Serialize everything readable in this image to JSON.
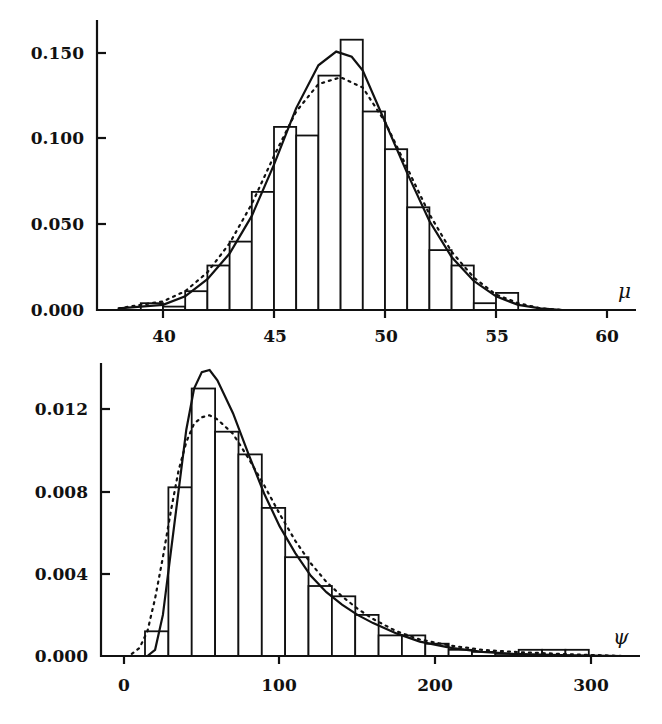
{
  "chart_data": [
    {
      "type": "bar",
      "subtype": "histogram with density overlays",
      "title": "",
      "xlabel": "μ",
      "ylabel": "",
      "xlim": [
        37.5,
        61.5
      ],
      "ylim": [
        0.0,
        0.16
      ],
      "xticks": [
        40,
        45,
        50,
        55,
        60
      ],
      "xtick_labels": [
        "40",
        "45",
        "50",
        "55",
        "60"
      ],
      "yticks": [
        0.0,
        0.05,
        0.1,
        0.15
      ],
      "ytick_labels": [
        "0.000",
        "0.050",
        "0.100",
        "0.150"
      ],
      "grid": false,
      "legend": null,
      "bins": [
        {
          "x0": 39.0,
          "x1": 40.0,
          "value": 0.004
        },
        {
          "x0": 40.0,
          "x1": 41.0,
          "value": 0.002
        },
        {
          "x0": 41.0,
          "x1": 42.0,
          "value": 0.011
        },
        {
          "x0": 42.0,
          "x1": 43.0,
          "value": 0.026
        },
        {
          "x0": 43.0,
          "x1": 44.0,
          "value": 0.04
        },
        {
          "x0": 44.0,
          "x1": 45.0,
          "value": 0.069
        },
        {
          "x0": 45.0,
          "x1": 46.0,
          "value": 0.107
        },
        {
          "x0": 46.0,
          "x1": 47.0,
          "value": 0.102
        },
        {
          "x0": 47.0,
          "x1": 48.0,
          "value": 0.137
        },
        {
          "x0": 48.0,
          "x1": 49.0,
          "value": 0.158
        },
        {
          "x0": 49.0,
          "x1": 50.0,
          "value": 0.116
        },
        {
          "x0": 50.0,
          "x1": 51.0,
          "value": 0.094
        },
        {
          "x0": 51.0,
          "x1": 52.0,
          "value": 0.06
        },
        {
          "x0": 52.0,
          "x1": 53.0,
          "value": 0.035
        },
        {
          "x0": 53.0,
          "x1": 54.0,
          "value": 0.026
        },
        {
          "x0": 54.0,
          "x1": 55.0,
          "value": 0.004
        },
        {
          "x0": 55.0,
          "x1": 56.0,
          "value": 0.01
        }
      ],
      "series": [
        {
          "name": "solid density",
          "style": "solid",
          "x": [
            38,
            40,
            41,
            42,
            43,
            44,
            45,
            46,
            47,
            47.8,
            48.5,
            49,
            50,
            51,
            52,
            53,
            54,
            55,
            56,
            57,
            58
          ],
          "values": [
            0.001,
            0.003,
            0.008,
            0.018,
            0.033,
            0.055,
            0.085,
            0.118,
            0.143,
            0.151,
            0.148,
            0.14,
            0.11,
            0.08,
            0.052,
            0.031,
            0.017,
            0.008,
            0.003,
            0.001,
            0.0
          ]
        },
        {
          "name": "dotted density",
          "style": "dotted",
          "x": [
            38,
            40,
            41,
            42,
            43,
            44,
            45,
            46,
            47,
            48,
            49,
            50,
            51,
            52,
            53,
            54,
            55,
            56,
            57,
            58
          ],
          "values": [
            0.001,
            0.005,
            0.011,
            0.022,
            0.039,
            0.062,
            0.09,
            0.116,
            0.132,
            0.136,
            0.13,
            0.11,
            0.083,
            0.056,
            0.034,
            0.019,
            0.009,
            0.004,
            0.001,
            0.0
          ]
        }
      ]
    },
    {
      "type": "bar",
      "subtype": "histogram with density overlays",
      "title": "",
      "xlabel": "ψ",
      "ylabel": "",
      "xlim": [
        -10,
        330
      ],
      "ylim": [
        0.0,
        0.014
      ],
      "xticks": [
        0,
        100,
        200,
        300
      ],
      "xtick_labels": [
        "0",
        "100",
        "200",
        "300"
      ],
      "yticks": [
        0.0,
        0.004,
        0.008,
        0.012
      ],
      "ytick_labels": [
        "0.000",
        "0.004",
        "0.008",
        "0.012"
      ],
      "grid": false,
      "legend": null,
      "bins": [
        {
          "x0": 13.5,
          "x1": 28.5,
          "value": 0.0012
        },
        {
          "x0": 28.5,
          "x1": 43.5,
          "value": 0.0082
        },
        {
          "x0": 43.5,
          "x1": 58.5,
          "value": 0.013
        },
        {
          "x0": 58.5,
          "x1": 73.5,
          "value": 0.0109
        },
        {
          "x0": 73.5,
          "x1": 88.5,
          "value": 0.0098
        },
        {
          "x0": 88.5,
          "x1": 103.5,
          "value": 0.0072
        },
        {
          "x0": 103.5,
          "x1": 118.5,
          "value": 0.0048
        },
        {
          "x0": 118.5,
          "x1": 133.5,
          "value": 0.0034
        },
        {
          "x0": 133.5,
          "x1": 148.5,
          "value": 0.0029
        },
        {
          "x0": 148.5,
          "x1": 163.5,
          "value": 0.002
        },
        {
          "x0": 163.5,
          "x1": 178.5,
          "value": 0.001
        },
        {
          "x0": 178.5,
          "x1": 193.5,
          "value": 0.001
        },
        {
          "x0": 193.5,
          "x1": 208.5,
          "value": 0.0006
        },
        {
          "x0": 208.5,
          "x1": 223.5,
          "value": 0.0003
        },
        {
          "x0": 223.5,
          "x1": 238.5,
          "value": 0.0002
        },
        {
          "x0": 238.5,
          "x1": 253.5,
          "value": 0.0001
        },
        {
          "x0": 253.5,
          "x1": 268.5,
          "value": 0.0003
        },
        {
          "x0": 268.5,
          "x1": 283.5,
          "value": 0.0003
        },
        {
          "x0": 283.5,
          "x1": 298.5,
          "value": 0.0003
        }
      ],
      "series": [
        {
          "name": "solid density",
          "style": "solid",
          "x": [
            15,
            20,
            25,
            30,
            40,
            45,
            50,
            55,
            60,
            70,
            80,
            90,
            100,
            110,
            120,
            130,
            140,
            150,
            160,
            175,
            190,
            210,
            230,
            250,
            280,
            320
          ],
          "values": [
            0.0,
            0.0003,
            0.002,
            0.005,
            0.011,
            0.013,
            0.0138,
            0.0139,
            0.0134,
            0.0118,
            0.0098,
            0.0079,
            0.0063,
            0.005,
            0.0039,
            0.0031,
            0.0025,
            0.002,
            0.0016,
            0.0011,
            0.0007,
            0.0004,
            0.0002,
            0.0001,
            5e-05,
            0.0
          ]
        },
        {
          "name": "dotted density",
          "style": "dotted",
          "x": [
            5,
            10,
            15,
            20,
            25,
            30,
            35,
            40,
            45,
            50,
            55,
            60,
            70,
            80,
            90,
            100,
            110,
            120,
            130,
            140,
            150,
            160,
            175,
            190,
            210,
            230,
            250,
            280,
            320
          ],
          "values": [
            0.0001,
            0.0004,
            0.0012,
            0.0028,
            0.0048,
            0.007,
            0.009,
            0.0104,
            0.0113,
            0.0116,
            0.0117,
            0.0115,
            0.0108,
            0.0096,
            0.0083,
            0.0069,
            0.0056,
            0.0045,
            0.0036,
            0.0029,
            0.0023,
            0.0018,
            0.0012,
            0.0008,
            0.0005,
            0.0003,
            0.0002,
            0.0001,
            0.0
          ]
        }
      ]
    }
  ],
  "panels": {
    "top": {
      "xlabel": "μ",
      "ytick_labels": [
        "0.150",
        "0.100",
        "0.050",
        "0.000"
      ],
      "xtick_labels": [
        "40",
        "45",
        "50",
        "55",
        "60"
      ]
    },
    "bottom": {
      "xlabel": "ψ",
      "ytick_labels": [
        "0.012",
        "0.008",
        "0.004",
        "0.000"
      ],
      "xtick_labels": [
        "0",
        "100",
        "200",
        "300"
      ]
    }
  }
}
